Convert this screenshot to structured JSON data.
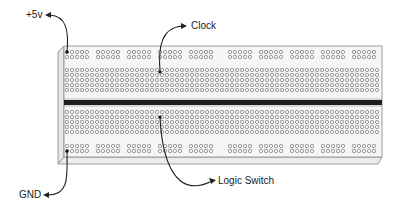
{
  "diagram": {
    "type": "breadboard",
    "labels": {
      "plus5v": "+5v",
      "clock": "Clock",
      "gnd": "GND",
      "logic_switch": "Logic Switch"
    },
    "colors": {
      "board_fill": "#f4f4f4",
      "board_edge": "#888888",
      "hole": "#7a7a7a",
      "divider": "#1e1e1e",
      "arrow": "#222222",
      "text": "#222222"
    },
    "layout": {
      "rail_groups_per_row": 10,
      "holes_per_rail_group": 5,
      "rail_rows_top": 2,
      "rail_rows_bottom": 2,
      "terminal_rows_top": 5,
      "terminal_rows_bottom": 5,
      "terminal_columns": 63
    }
  }
}
